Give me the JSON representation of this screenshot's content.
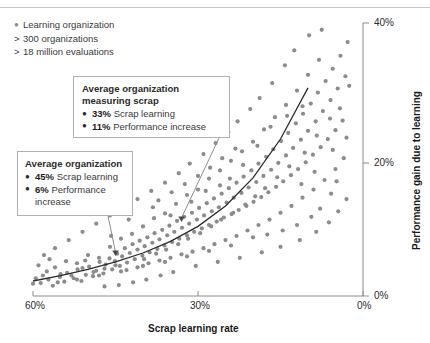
{
  "legend": {
    "items": [
      {
        "marker": "dot",
        "label": "Learning organization"
      },
      {
        "marker": "gt",
        "label": "300 organizations"
      },
      {
        "marker": "gt",
        "label": "18 million evaluations"
      }
    ]
  },
  "callouts": {
    "measuring_scrap": {
      "title_line1": "Average organization",
      "title_line2": "measuring scrap",
      "item1_value": "33%",
      "item1_label": "Scrap learning",
      "item2_value": "11%",
      "item2_label": "Performance increase",
      "point_x_pct": 33,
      "point_y_pct": 11
    },
    "average": {
      "title_line1": "Average organization",
      "item1_value": "45%",
      "item1_label": "Scrap learning",
      "item2_value": "6%",
      "item2_label": "Performance",
      "item2_label_cont": "increase",
      "point_x_pct": 45,
      "point_y_pct": 6
    }
  },
  "colors": {
    "dot": "#8c8c8c",
    "curve": "#2b2b2b",
    "axis": "#8c8c8c",
    "box_border": "#b0b0b0",
    "text": "#2b2b2b"
  },
  "chart_data": {
    "type": "scatter",
    "title": "",
    "xlabel": "Scrap learning rate",
    "ylabel": "Performance gain due to learning",
    "xlim": [
      60,
      0
    ],
    "ylim": [
      0,
      40
    ],
    "x_ticks": [
      "60%",
      "30%",
      "0%"
    ],
    "x_tick_values": [
      60,
      30,
      0
    ],
    "y_ticks": [
      "0%",
      "20%",
      "40%"
    ],
    "y_tick_values": [
      0,
      20,
      40
    ],
    "x_axis_inverted": true,
    "grid": false,
    "legend_position": "top-left",
    "annotations": [
      {
        "label": "Average organization",
        "x": 45,
        "y": 6
      },
      {
        "label": "Average organization measuring scrap",
        "x": 33,
        "y": 11
      }
    ],
    "trend": {
      "name": "fitted trend",
      "type": "exponential",
      "x": [
        60,
        55,
        50,
        45,
        40,
        35,
        30,
        25,
        20,
        15,
        10
      ],
      "y": [
        2.2,
        3.0,
        3.9,
        5.0,
        6.3,
        8.0,
        10.2,
        13.2,
        17.3,
        23.0,
        30.5
      ]
    },
    "series": [
      {
        "name": "Learning organization",
        "points": [
          [
            58.6,
            1.9
          ],
          [
            57.2,
            2.4
          ],
          [
            56.4,
            1.5
          ],
          [
            55.1,
            2.8
          ],
          [
            54.3,
            2.1
          ],
          [
            53.8,
            3.4
          ],
          [
            52.6,
            2.6
          ],
          [
            51.9,
            3.9
          ],
          [
            51.2,
            2.2
          ],
          [
            50.4,
            3.1
          ],
          [
            49.8,
            4.3
          ],
          [
            49.1,
            2.9
          ],
          [
            48.5,
            3.7
          ],
          [
            47.9,
            5.0
          ],
          [
            47.2,
            3.3
          ],
          [
            46.8,
            4.6
          ],
          [
            46.1,
            5.5
          ],
          [
            45.6,
            3.9
          ],
          [
            45.1,
            5.1
          ],
          [
            44.7,
            6.2
          ],
          [
            44.2,
            4.4
          ],
          [
            43.8,
            5.8
          ],
          [
            43.3,
            7.0
          ],
          [
            42.9,
            4.9
          ],
          [
            42.4,
            6.3
          ],
          [
            41.9,
            7.6
          ],
          [
            41.5,
            5.4
          ],
          [
            41.0,
            6.8
          ],
          [
            40.6,
            8.1
          ],
          [
            40.1,
            5.9
          ],
          [
            39.7,
            7.3
          ],
          [
            39.2,
            8.6
          ],
          [
            38.8,
            6.4
          ],
          [
            38.3,
            7.8
          ],
          [
            37.9,
            9.2
          ],
          [
            37.4,
            6.9
          ],
          [
            37.0,
            8.3
          ],
          [
            36.5,
            9.7
          ],
          [
            36.1,
            7.4
          ],
          [
            35.6,
            8.9
          ],
          [
            35.2,
            10.3
          ],
          [
            34.7,
            7.9
          ],
          [
            34.3,
            9.4
          ],
          [
            33.8,
            11.0
          ],
          [
            33.4,
            8.4
          ],
          [
            32.9,
            10.0
          ],
          [
            32.5,
            11.6
          ],
          [
            32.0,
            8.9
          ],
          [
            31.6,
            10.6
          ],
          [
            31.1,
            12.2
          ],
          [
            30.7,
            9.4
          ],
          [
            30.2,
            11.2
          ],
          [
            29.8,
            12.9
          ],
          [
            29.3,
            9.9
          ],
          [
            28.9,
            11.8
          ],
          [
            28.4,
            13.6
          ],
          [
            28.0,
            10.4
          ],
          [
            27.5,
            12.4
          ],
          [
            27.1,
            14.3
          ],
          [
            26.6,
            10.9
          ],
          [
            26.2,
            13.0
          ],
          [
            25.7,
            15.0
          ],
          [
            25.3,
            11.5
          ],
          [
            24.8,
            13.7
          ],
          [
            24.4,
            15.8
          ],
          [
            23.9,
            12.0
          ],
          [
            23.5,
            14.4
          ],
          [
            23.0,
            16.6
          ],
          [
            22.6,
            12.6
          ],
          [
            22.1,
            15.1
          ],
          [
            21.7,
            17.5
          ],
          [
            21.2,
            13.2
          ],
          [
            20.8,
            15.9
          ],
          [
            20.3,
            18.4
          ],
          [
            19.9,
            13.8
          ],
          [
            19.4,
            16.7
          ],
          [
            19.0,
            19.4
          ],
          [
            18.5,
            14.5
          ],
          [
            18.1,
            17.6
          ],
          [
            17.6,
            20.4
          ],
          [
            17.2,
            15.2
          ],
          [
            16.7,
            18.5
          ],
          [
            16.3,
            21.5
          ],
          [
            15.8,
            16.0
          ],
          [
            15.4,
            19.5
          ],
          [
            14.9,
            22.7
          ],
          [
            14.5,
            16.8
          ],
          [
            14.0,
            20.6
          ],
          [
            13.6,
            23.9
          ],
          [
            13.1,
            17.7
          ],
          [
            12.7,
            21.7
          ],
          [
            12.2,
            25.3
          ],
          [
            11.8,
            18.6
          ],
          [
            11.3,
            22.9
          ],
          [
            10.9,
            26.7
          ],
          [
            10.4,
            19.6
          ],
          [
            10.0,
            24.2
          ],
          [
            9.5,
            28.2
          ],
          [
            9.1,
            20.7
          ],
          [
            8.6,
            25.6
          ],
          [
            8.2,
            29.8
          ],
          [
            7.7,
            21.8
          ],
          [
            7.3,
            27.1
          ],
          [
            6.8,
            31.5
          ],
          [
            6.4,
            23.0
          ],
          [
            5.9,
            28.7
          ],
          [
            5.5,
            33.3
          ],
          [
            5.0,
            24.3
          ],
          [
            4.6,
            30.4
          ],
          [
            4.1,
            35.2
          ],
          [
            3.7,
            25.7
          ],
          [
            3.2,
            32.2
          ],
          [
            2.8,
            37.2
          ],
          [
            56.0,
            4.2
          ],
          [
            54.0,
            5.1
          ],
          [
            52.0,
            4.8
          ],
          [
            50.0,
            6.0
          ],
          [
            48.0,
            5.6
          ],
          [
            46.0,
            7.2
          ],
          [
            44.0,
            8.4
          ],
          [
            42.0,
            9.1
          ],
          [
            40.0,
            10.2
          ],
          [
            38.0,
            11.4
          ],
          [
            36.0,
            12.1
          ],
          [
            34.0,
            13.5
          ],
          [
            32.0,
            14.8
          ],
          [
            30.0,
            15.6
          ],
          [
            28.0,
            17.2
          ],
          [
            26.0,
            18.4
          ],
          [
            24.0,
            19.8
          ],
          [
            22.0,
            21.2
          ],
          [
            20.0,
            22.6
          ],
          [
            18.0,
            24.4
          ],
          [
            16.0,
            26.2
          ],
          [
            14.0,
            28.0
          ],
          [
            12.0,
            30.1
          ],
          [
            10.0,
            32.4
          ],
          [
            8.0,
            34.6
          ],
          [
            57.5,
            3.6
          ],
          [
            55.5,
            2.0
          ],
          [
            53.0,
            3.0
          ],
          [
            51.0,
            4.1
          ],
          [
            49.0,
            3.5
          ],
          [
            47.0,
            4.0
          ],
          [
            45.0,
            4.5
          ],
          [
            43.0,
            3.8
          ],
          [
            41.0,
            4.2
          ],
          [
            39.0,
            4.8
          ],
          [
            37.0,
            5.2
          ],
          [
            35.0,
            5.6
          ],
          [
            33.0,
            6.1
          ],
          [
            31.0,
            6.5
          ],
          [
            29.0,
            7.0
          ],
          [
            27.0,
            7.6
          ],
          [
            25.0,
            8.2
          ],
          [
            23.0,
            8.8
          ],
          [
            21.0,
            9.6
          ],
          [
            19.0,
            10.4
          ],
          [
            17.0,
            11.2
          ],
          [
            15.0,
            12.2
          ],
          [
            13.0,
            13.2
          ],
          [
            11.0,
            14.4
          ],
          [
            9.0,
            15.6
          ],
          [
            7.0,
            17.0
          ],
          [
            5.0,
            18.6
          ],
          [
            3.5,
            20.2
          ],
          [
            12.5,
            36.0
          ],
          [
            14.2,
            33.8
          ],
          [
            9.8,
            38.2
          ],
          [
            7.5,
            39.0
          ],
          [
            16.5,
            31.2
          ],
          [
            18.8,
            29.0
          ],
          [
            20.5,
            27.4
          ],
          [
            22.8,
            25.6
          ],
          [
            24.5,
            24.0
          ],
          [
            26.8,
            22.4
          ],
          [
            29.0,
            20.8
          ],
          [
            31.5,
            19.4
          ],
          [
            33.5,
            18.0
          ],
          [
            36.0,
            16.6
          ],
          [
            38.5,
            15.4
          ],
          [
            41.0,
            14.2
          ],
          [
            43.5,
            13.0
          ],
          [
            46.0,
            11.8
          ],
          [
            48.5,
            10.6
          ],
          [
            51.0,
            9.4
          ],
          [
            53.5,
            8.2
          ],
          [
            56.0,
            7.0
          ],
          [
            58.0,
            6.0
          ],
          [
            59.0,
            4.5
          ],
          [
            59.5,
            2.6
          ],
          [
            60.0,
            1.8
          ],
          [
            4.2,
            27.5
          ],
          [
            6.0,
            26.0
          ],
          [
            8.4,
            23.5
          ],
          [
            10.6,
            21.0
          ],
          [
            13.4,
            19.0
          ],
          [
            15.6,
            17.4
          ],
          [
            17.8,
            15.8
          ],
          [
            19.6,
            14.6
          ],
          [
            21.4,
            13.4
          ],
          [
            23.6,
            12.2
          ],
          [
            25.8,
            11.2
          ],
          [
            27.6,
            10.2
          ],
          [
            29.6,
            9.2
          ],
          [
            31.8,
            8.4
          ],
          [
            33.6,
            7.6
          ],
          [
            35.8,
            6.8
          ],
          [
            37.6,
            6.2
          ],
          [
            39.8,
            5.4
          ],
          [
            2.5,
            30.8
          ],
          [
            3.0,
            23.2
          ],
          [
            5.5,
            21.4
          ],
          [
            8.8,
            18.2
          ],
          [
            11.2,
            16.4
          ],
          [
            34.5,
            3.5
          ],
          [
            36.8,
            3.0
          ],
          [
            39.4,
            2.4
          ],
          [
            41.8,
            2.0
          ],
          [
            44.4,
            1.6
          ],
          [
            47.0,
            1.4
          ],
          [
            30.4,
            4.4
          ],
          [
            26.4,
            5.0
          ],
          [
            22.4,
            5.6
          ],
          [
            18.4,
            6.4
          ],
          [
            15.0,
            7.2
          ],
          [
            11.5,
            8.2
          ],
          [
            8.5,
            9.4
          ],
          [
            6.2,
            10.8
          ],
          [
            4.5,
            12.4
          ],
          [
            3.0,
            14.2
          ],
          [
            19.2,
            22.0
          ],
          [
            21.8,
            19.2
          ],
          [
            24.2,
            17.2
          ],
          [
            16.8,
            24.8
          ],
          [
            13.8,
            26.4
          ],
          [
            11.0,
            27.8
          ],
          [
            23.2,
            21.6
          ],
          [
            25.6,
            20.2
          ],
          [
            27.8,
            18.8
          ],
          [
            30.0,
            17.6
          ],
          [
            32.4,
            16.4
          ],
          [
            34.8,
            15.2
          ],
          [
            37.2,
            14.0
          ],
          [
            20.0,
            8.6
          ],
          [
            24.0,
            7.4
          ],
          [
            28.0,
            6.6
          ],
          [
            32.0,
            5.8
          ],
          [
            36.0,
            5.0
          ],
          [
            40.0,
            4.4
          ],
          [
            44.0,
            3.6
          ],
          [
            48.0,
            3.0
          ],
          [
            52.0,
            2.4
          ],
          [
            55.0,
            3.2
          ],
          [
            57.0,
            5.4
          ],
          [
            58.2,
            3.0
          ],
          [
            50.5,
            5.2
          ],
          [
            45.8,
            8.8
          ],
          [
            42.6,
            11.2
          ],
          [
            38.2,
            13.0
          ],
          [
            35.0,
            11.8
          ],
          [
            31.2,
            13.8
          ],
          [
            28.6,
            15.4
          ],
          [
            26.0,
            16.2
          ],
          [
            7.8,
            12.8
          ],
          [
            9.4,
            11.6
          ],
          [
            5.8,
            15.0
          ],
          [
            4.8,
            16.8
          ],
          [
            12.0,
            10.4
          ],
          [
            14.6,
            9.6
          ],
          [
            17.4,
            9.0
          ]
        ]
      }
    ]
  }
}
